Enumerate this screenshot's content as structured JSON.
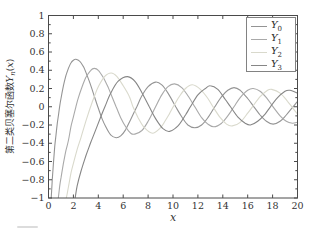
{
  "figure": {
    "ylabel": {
      "prefix": "第二类贝塞尔函数",
      "symbol": "Y",
      "subscript": "n",
      "open": "(",
      "var": "x",
      "close": ")"
    },
    "xlabel": "x",
    "frame_color": "#4a4a4a",
    "text_color": "#333333"
  },
  "chart_data": {
    "type": "line",
    "title": "",
    "xlabel": "x",
    "ylabel": "第二类贝塞尔函数Y_n(x)",
    "xlim": [
      0,
      20
    ],
    "ylim": [
      -1,
      1
    ],
    "xticks": [
      0,
      2,
      4,
      6,
      8,
      10,
      12,
      14,
      16,
      18,
      20
    ],
    "yticks": [
      -1,
      -0.8,
      -0.6,
      -0.4,
      -0.2,
      0,
      0.2,
      0.4,
      0.6,
      0.8,
      1
    ],
    "ytick_minor_step": 0.1,
    "grid": false,
    "legend_position": "top-right",
    "series": [
      {
        "name": "Y0",
        "label_base": "Y",
        "label_sub": "0",
        "color": "#949494",
        "points": [
          [
            0.22,
            -1
          ],
          [
            0.3,
            -0.81
          ],
          [
            0.4,
            -0.61
          ],
          [
            0.5,
            -0.44
          ],
          [
            0.6,
            -0.31
          ],
          [
            0.7,
            -0.19
          ],
          [
            0.8,
            -0.09
          ],
          [
            0.89,
            0
          ],
          [
            1.0,
            0.09
          ],
          [
            1.2,
            0.23
          ],
          [
            1.4,
            0.34
          ],
          [
            1.6,
            0.42
          ],
          [
            1.8,
            0.48
          ],
          [
            2.0,
            0.51
          ],
          [
            2.2,
            0.52
          ],
          [
            2.5,
            0.5
          ],
          [
            2.8,
            0.44
          ],
          [
            3.0,
            0.38
          ],
          [
            3.3,
            0.27
          ],
          [
            3.6,
            0.15
          ],
          [
            3.96,
            0
          ],
          [
            4.3,
            -0.13
          ],
          [
            4.6,
            -0.22
          ],
          [
            5.0,
            -0.31
          ],
          [
            5.43,
            -0.34
          ],
          [
            5.8,
            -0.32
          ],
          [
            6.2,
            -0.25
          ],
          [
            6.6,
            -0.14
          ],
          [
            7.09,
            0
          ],
          [
            7.5,
            0.12
          ],
          [
            8.0,
            0.22
          ],
          [
            8.6,
            0.27
          ],
          [
            9.1,
            0.24
          ],
          [
            9.6,
            0.15
          ],
          [
            10.22,
            0
          ],
          [
            10.7,
            -0.11
          ],
          [
            11.2,
            -0.2
          ],
          [
            11.75,
            -0.23
          ],
          [
            12.3,
            -0.2
          ],
          [
            12.8,
            -0.12
          ],
          [
            13.36,
            0
          ],
          [
            13.9,
            0.11
          ],
          [
            14.4,
            0.18
          ],
          [
            14.9,
            0.21
          ],
          [
            15.4,
            0.18
          ],
          [
            16.0,
            0.09
          ],
          [
            16.5,
            0
          ],
          [
            17.0,
            -0.09
          ],
          [
            17.5,
            -0.16
          ],
          [
            18.04,
            -0.19
          ],
          [
            18.6,
            -0.16
          ],
          [
            19.1,
            -0.09
          ],
          [
            19.64,
            0
          ],
          [
            20.0,
            0.06
          ]
        ]
      },
      {
        "name": "Y1",
        "label_base": "Y",
        "label_sub": "1",
        "color": "#a9a9a9",
        "points": [
          [
            0.79,
            -1
          ],
          [
            0.9,
            -0.87
          ],
          [
            1.0,
            -0.78
          ],
          [
            1.2,
            -0.62
          ],
          [
            1.4,
            -0.48
          ],
          [
            1.6,
            -0.37
          ],
          [
            1.8,
            -0.22
          ],
          [
            2.0,
            -0.11
          ],
          [
            2.2,
            0
          ],
          [
            2.4,
            0.1
          ],
          [
            2.7,
            0.22
          ],
          [
            3.0,
            0.32
          ],
          [
            3.4,
            0.4
          ],
          [
            3.68,
            0.42
          ],
          [
            4.0,
            0.4
          ],
          [
            4.4,
            0.32
          ],
          [
            4.8,
            0.21
          ],
          [
            5.1,
            0.11
          ],
          [
            5.43,
            0
          ],
          [
            5.8,
            -0.12
          ],
          [
            6.2,
            -0.22
          ],
          [
            6.6,
            -0.29
          ],
          [
            6.94,
            -0.3
          ],
          [
            7.5,
            -0.26
          ],
          [
            8.0,
            -0.16
          ],
          [
            8.6,
            0
          ],
          [
            9.1,
            0.13
          ],
          [
            9.6,
            0.22
          ],
          [
            10.12,
            0.25
          ],
          [
            10.7,
            0.21
          ],
          [
            11.2,
            0.12
          ],
          [
            11.75,
            0
          ],
          [
            12.3,
            -0.12
          ],
          [
            12.8,
            -0.19
          ],
          [
            13.29,
            -0.22
          ],
          [
            13.9,
            -0.18
          ],
          [
            14.4,
            -0.1
          ],
          [
            14.9,
            0
          ],
          [
            15.4,
            0.1
          ],
          [
            16.0,
            0.18
          ],
          [
            16.44,
            0.2
          ],
          [
            17.0,
            0.17
          ],
          [
            17.5,
            0.1
          ],
          [
            18.04,
            0
          ],
          [
            18.6,
            -0.1
          ],
          [
            19.1,
            -0.16
          ],
          [
            19.59,
            -0.18
          ],
          [
            20.0,
            -0.17
          ]
        ]
      },
      {
        "name": "Y2",
        "label_base": "Y",
        "label_sub": "2",
        "color": "#d9d9cc",
        "points": [
          [
            1.43,
            -1
          ],
          [
            1.6,
            -0.88
          ],
          [
            1.8,
            -0.73
          ],
          [
            2.0,
            -0.62
          ],
          [
            2.3,
            -0.47
          ],
          [
            2.6,
            -0.34
          ],
          [
            3.0,
            -0.16
          ],
          [
            3.38,
            0
          ],
          [
            3.7,
            0.12
          ],
          [
            4.0,
            0.22
          ],
          [
            4.5,
            0.33
          ],
          [
            5.03,
            0.37
          ],
          [
            5.5,
            0.33
          ],
          [
            6.0,
            0.23
          ],
          [
            6.5,
            0.11
          ],
          [
            6.79,
            0
          ],
          [
            7.2,
            -0.12
          ],
          [
            7.7,
            -0.23
          ],
          [
            8.35,
            -0.29
          ],
          [
            9.0,
            -0.23
          ],
          [
            9.35,
            -0.16
          ],
          [
            9.7,
            -0.08
          ],
          [
            10.02,
            0
          ],
          [
            10.5,
            0.11
          ],
          [
            11.0,
            0.2
          ],
          [
            11.56,
            0.24
          ],
          [
            12.2,
            0.19
          ],
          [
            12.8,
            0.09
          ],
          [
            13.21,
            0
          ],
          [
            13.8,
            -0.12
          ],
          [
            14.3,
            -0.19
          ],
          [
            14.76,
            -0.21
          ],
          [
            15.4,
            -0.17
          ],
          [
            16.0,
            -0.07
          ],
          [
            16.38,
            0
          ],
          [
            17.0,
            0.11
          ],
          [
            17.6,
            0.18
          ],
          [
            17.93,
            0.19
          ],
          [
            18.6,
            0.15
          ],
          [
            19.2,
            0.06
          ],
          [
            19.54,
            0
          ],
          [
            20.0,
            -0.08
          ]
        ]
      },
      {
        "name": "Y3",
        "label_base": "Y",
        "label_sub": "3",
        "color": "#868686",
        "points": [
          [
            2.14,
            -1
          ],
          [
            2.3,
            -0.87
          ],
          [
            2.6,
            -0.71
          ],
          [
            3.0,
            -0.54
          ],
          [
            3.4,
            -0.39
          ],
          [
            3.8,
            -0.25
          ],
          [
            4.2,
            -0.11
          ],
          [
            4.53,
            0
          ],
          [
            5.0,
            0.15
          ],
          [
            5.6,
            0.28
          ],
          [
            6.35,
            0.33
          ],
          [
            7.0,
            0.27
          ],
          [
            7.6,
            0.13
          ],
          [
            8.1,
            0
          ],
          [
            8.6,
            -0.13
          ],
          [
            9.2,
            -0.24
          ],
          [
            9.72,
            -0.27
          ],
          [
            10.4,
            -0.21
          ],
          [
            11.0,
            -0.09
          ],
          [
            11.4,
            0
          ],
          [
            12.0,
            0.13
          ],
          [
            12.6,
            0.2
          ],
          [
            12.99,
            0.23
          ],
          [
            13.6,
            0.19
          ],
          [
            14.2,
            0.08
          ],
          [
            14.62,
            0
          ],
          [
            15.2,
            -0.11
          ],
          [
            15.8,
            -0.18
          ],
          [
            16.22,
            -0.2
          ],
          [
            16.8,
            -0.16
          ],
          [
            17.4,
            -0.08
          ],
          [
            17.82,
            0
          ],
          [
            18.4,
            0.1
          ],
          [
            19.0,
            0.17
          ],
          [
            19.4,
            0.18
          ],
          [
            20.0,
            0.15
          ]
        ]
      }
    ]
  }
}
